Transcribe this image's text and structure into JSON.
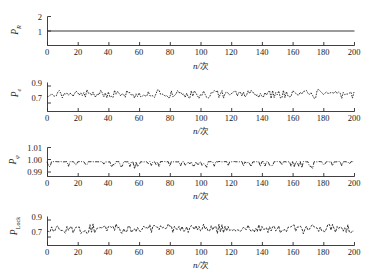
{
  "figure": {
    "type": "multi-panel-line-chart",
    "panel_count": 4,
    "background": "#ffffff",
    "line_color": "#1f1f1f"
  },
  "xaxis": {
    "label_var": "n",
    "label_sep": "/",
    "label_unit": "次",
    "ticks": [
      "0",
      "20",
      "40",
      "60",
      "80",
      "100",
      "120",
      "140",
      "160",
      "180",
      "200"
    ],
    "min": 0,
    "max": 200
  },
  "chart_data": [
    {
      "type": "line",
      "id": "panel-1",
      "title": "",
      "ylabel": "P_R",
      "ylabel_base": "P",
      "ylabel_sub": "R",
      "xlabel": "n/次",
      "xlim": [
        0,
        200
      ],
      "ylim": [
        0,
        2
      ],
      "yticks": [
        "1",
        "2"
      ],
      "ytick_values": [
        1,
        2
      ],
      "grid": false,
      "legend": "none",
      "linestyle": "solid",
      "marker": "none",
      "x": [
        0,
        200
      ],
      "values_constant": 1.0,
      "description": "Flat constant line at 1 across all 200 samples"
    },
    {
      "type": "line",
      "id": "panel-2",
      "title": "",
      "ylabel": "P_e",
      "ylabel_base": "P",
      "ylabel_sub": "e",
      "xlabel": "n/次",
      "xlim": [
        0,
        200
      ],
      "ylim": [
        0.6,
        0.95
      ],
      "yticks": [
        "0.7",
        "0.9"
      ],
      "ytick_values": [
        0.7,
        0.9
      ],
      "grid": false,
      "legend": "none",
      "linestyle": "dotted-noisy",
      "marker": "dot",
      "mean": 0.805,
      "noise_amplitude": 0.045,
      "seed": 21,
      "description": "Noisy dotted trace fluctuating about 0.80 between roughly 0.75 and 0.87"
    },
    {
      "type": "line",
      "id": "panel-3",
      "title": "",
      "ylabel": "P_phi",
      "ylabel_base": "P",
      "ylabel_sub": "φ",
      "xlabel": "n/次",
      "xlim": [
        0,
        200
      ],
      "ylim": [
        0.99,
        1.01
      ],
      "yticks": [
        "0.99",
        "1.00",
        "1.01"
      ],
      "ytick_values": [
        0.99,
        1.0,
        1.01
      ],
      "grid": false,
      "legend": "none",
      "linestyle": "dash-dot",
      "marker": "none",
      "mean": 1.0,
      "noise_amplitude": 0.0018,
      "seed": 7,
      "description": "Dash-dot line pinned at 1.00 with sparse downward dips toward 0.996"
    },
    {
      "type": "line",
      "id": "panel-4",
      "title": "",
      "ylabel": "P_Lock",
      "ylabel_base": "P",
      "ylabel_sub": "Lock",
      "xlabel": "n/次",
      "xlim": [
        0,
        200
      ],
      "ylim": [
        0.6,
        0.95
      ],
      "yticks": [
        "0.7",
        "0.9"
      ],
      "ytick_values": [
        0.7,
        0.9
      ],
      "grid": false,
      "legend": "none",
      "linestyle": "dashed-noisy",
      "marker": "dot",
      "mean": 0.795,
      "noise_amplitude": 0.05,
      "seed": 43,
      "description": "Dashed noisy trace fluctuating about 0.80 between roughly 0.73 and 0.87"
    }
  ]
}
